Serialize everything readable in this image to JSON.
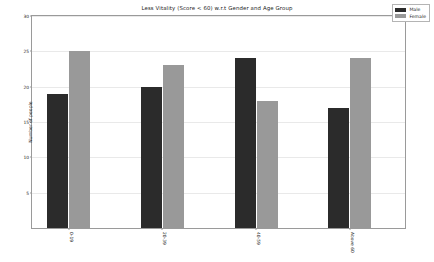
{
  "chart_data": {
    "type": "bar",
    "title": "Less Vitality (Score < 60) w.r.t Gender and Age Group",
    "xlabel": "",
    "ylabel": "Number of people",
    "categories": [
      "0-19",
      "20-39",
      "40-59",
      "Above 60"
    ],
    "series": [
      {
        "name": "Male",
        "color": "#2b2b2b",
        "values": [
          19,
          20,
          24,
          17
        ]
      },
      {
        "name": "Female",
        "color": "#999999",
        "values": [
          25,
          23,
          18,
          24
        ]
      }
    ],
    "ylim": [
      0,
      30
    ],
    "yticks": [
      5,
      10,
      15,
      20,
      25,
      30
    ],
    "ytick_labels": [
      "5",
      "10",
      "15",
      "20",
      "25",
      "30"
    ],
    "grid": true,
    "legend_position": "upper right",
    "xtick_rotation": 90
  },
  "legend": {
    "items": [
      {
        "label": "Male",
        "color": "#2b2b2b"
      },
      {
        "label": "Female",
        "color": "#999999"
      }
    ]
  }
}
